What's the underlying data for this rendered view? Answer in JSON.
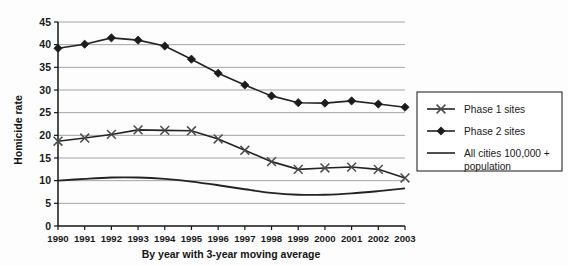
{
  "chart_data": {
    "type": "line",
    "title": "",
    "xlabel": "By year with 3-year moving average",
    "ylabel": "Homicide rate",
    "categories": [
      "1990",
      "1991",
      "1992",
      "1993",
      "1994",
      "1995",
      "1996",
      "1997",
      "1998",
      "1999",
      "2000",
      "2001",
      "2002",
      "2003"
    ],
    "x_tick_labels": [
      "1990",
      "1991",
      "1992",
      "1993",
      "1994",
      "1995",
      "1996",
      "1997",
      "1998",
      "1999",
      "2000",
      "2001",
      "2002",
      "2003"
    ],
    "y_tick_labels": [
      "0",
      "5",
      "10",
      "15",
      "20",
      "25",
      "30",
      "35",
      "40",
      "45"
    ],
    "ylim": [
      0,
      45
    ],
    "y_ticks": [
      0,
      5,
      10,
      15,
      20,
      25,
      30,
      35,
      40,
      45
    ],
    "grid": "horizontal",
    "legend_position": "right",
    "series": [
      {
        "name": "Phase 1 sites",
        "marker": "cross",
        "values": [
          18.7,
          19.4,
          20.2,
          21.2,
          21.1,
          21.0,
          19.2,
          16.7,
          14.2,
          12.5,
          12.8,
          13.0,
          12.5,
          10.6
        ]
      },
      {
        "name": "Phase 2 sites",
        "marker": "diamond",
        "values": [
          39.2,
          40.1,
          41.5,
          41.0,
          39.7,
          36.8,
          33.7,
          31.1,
          28.7,
          27.2,
          27.1,
          27.6,
          26.9,
          26.2
        ]
      },
      {
        "name": "All cities 100,000 + population",
        "marker": "none",
        "smooth": true,
        "values": [
          10.0,
          10.4,
          10.7,
          10.7,
          10.4,
          9.8,
          9.0,
          8.1,
          7.3,
          6.9,
          6.9,
          7.2,
          7.7,
          8.3
        ]
      }
    ],
    "colors": {
      "series_line": "#232323",
      "gridline": "#9a9a9a",
      "axis": "#151515",
      "marker_cross": "#4a4a4a",
      "marker_diamond": "#1c1c1c"
    }
  },
  "legend": {
    "entries": [
      {
        "label": "Phase 1 sites",
        "marker": "cross-marker"
      },
      {
        "label": "Phase 2 sites",
        "marker": "diamond-marker"
      },
      {
        "label": "All cities 100,000 +",
        "label_line2": "population",
        "marker": "plain-line-marker"
      }
    ]
  }
}
